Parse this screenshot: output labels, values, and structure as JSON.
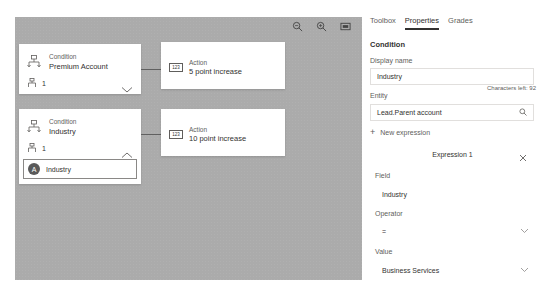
{
  "canvas": {
    "toolbar": [
      {
        "name": "zoom-out-icon",
        "label": "Zoom out"
      },
      {
        "name": "zoom-in-icon",
        "label": "Zoom in"
      },
      {
        "name": "fit-to-screen-icon",
        "label": "Fit to screen"
      }
    ],
    "conditions": [
      {
        "type": "Condition",
        "name": "Premium Account",
        "branch_count": "1",
        "expanded": false,
        "action": {
          "type": "Action",
          "name": "5 point increase",
          "icon_text": "123"
        }
      },
      {
        "type": "Condition",
        "name": "Industry",
        "branch_count": "1",
        "expanded": true,
        "chip": {
          "avatar": "A",
          "label": "Industry"
        },
        "action": {
          "type": "Action",
          "name": "10 point increase",
          "icon_text": "123"
        }
      }
    ]
  },
  "panel": {
    "tabs": [
      {
        "label": "Toolbox",
        "active": false
      },
      {
        "label": "Properties",
        "active": true
      },
      {
        "label": "Grades",
        "active": false
      }
    ],
    "section_title": "Condition",
    "display_name": {
      "label": "Display name",
      "value": "Industry",
      "hint": "Characters left: 92"
    },
    "entity": {
      "label": "Entity",
      "value": "Lead.Parent account"
    },
    "new_expression_label": "New expression",
    "expression": {
      "title": "Expression 1",
      "field": {
        "label": "Field",
        "value": "Industry"
      },
      "operator": {
        "label": "Operator",
        "value": "="
      },
      "value": {
        "label": "Value",
        "value": "Business Services"
      }
    }
  }
}
